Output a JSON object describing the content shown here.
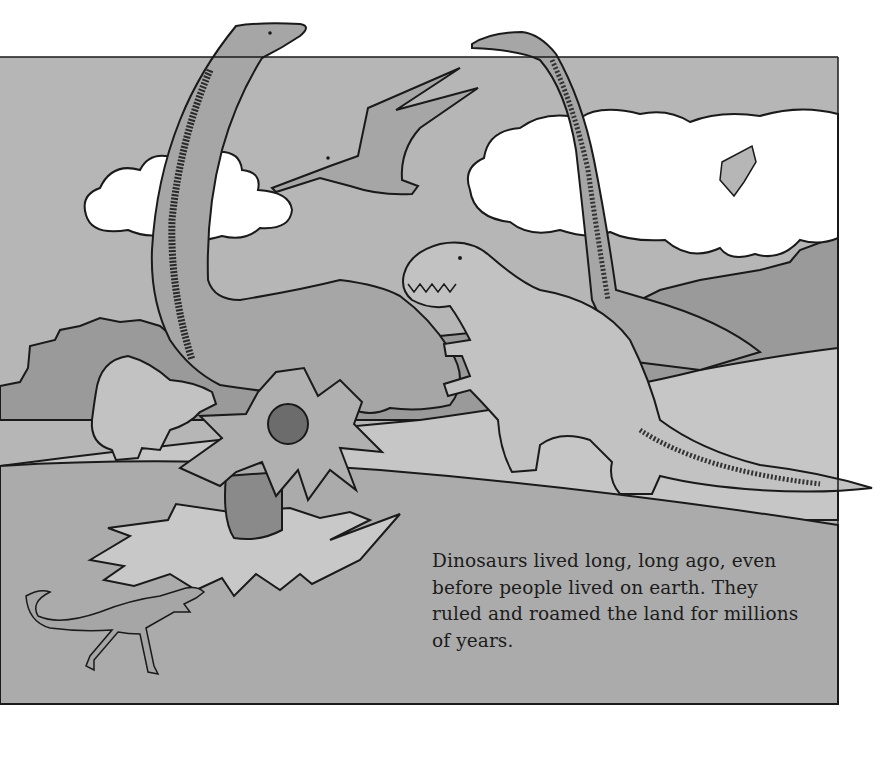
{
  "page": {
    "illustration": {
      "subject": "Dinosaur scene: two long-necked sauropods, a flying pterosaur, a Tyrannosaurus, a Triceratops, a small running dinosaur, and a large cycad-like plant in a hilly landscape with clouds",
      "colors": {
        "sky": "#b6b6b6",
        "far_hills": "#9a9a9a",
        "mid_ground": "#c6c6c6",
        "fore_ground": "#ababab",
        "cloud": "#ffffff",
        "outline": "#1a1a1a",
        "dino_light": "#c2c2c2",
        "dino_mid": "#a6a6a6",
        "plant_trunk": "#8a8a8a",
        "page": "#ffffff"
      }
    },
    "caption": {
      "lines": [
        "Dinosaurs lived long, long ago, even",
        "before people lived on earth. They",
        "ruled and roamed the land for millions",
        "of years."
      ]
    }
  }
}
